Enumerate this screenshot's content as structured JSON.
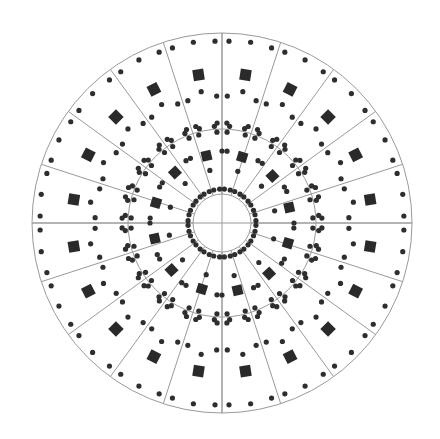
{
  "diagram": {
    "type": "concentric-radial-layout",
    "canvas": {
      "width": 440,
      "height": 439,
      "background": "#ffffff"
    },
    "center": {
      "x": 222,
      "y": 223
    },
    "colors": {
      "line": "#9a9a9a",
      "dot": "#2e2e2e",
      "square": "#2a2a2a"
    },
    "circles": [
      {
        "name": "outer-circle",
        "r": 190
      },
      {
        "name": "middle-circle",
        "r": 94
      },
      {
        "name": "inner-circle",
        "r": 29
      }
    ],
    "cross_lines": {
      "extent": 190
    },
    "radial_lines": {
      "count": 20,
      "start_deg": 0,
      "step_deg": 18,
      "r_from": 29,
      "r_to": 190
    },
    "outer_ring": {
      "sector_count": 20,
      "square": {
        "r": 150,
        "size": 11,
        "offset_deg": 9
      },
      "square_dot": {
        "r": 133,
        "offset_deg": 9
      },
      "rim_mid_dot": {
        "r": 183,
        "offset_deg": 9
      },
      "rim_pair_dots": {
        "r": 182,
        "spread_deg": 2.2
      },
      "line_pair_dots": {
        "r": 127,
        "spread_deg": 2.4
      }
    },
    "middle_ring": {
      "circle_dots": {
        "r": 97,
        "count": 40,
        "offset_deg": 4.5
      },
      "line_pair_dots": {
        "r": 91,
        "spread_deg": 3.2
      },
      "line_pair_dots_outer": {
        "r": 100,
        "spread_deg": 2.8
      }
    },
    "inner_ring": {
      "sector_count": 12,
      "square": {
        "r": 69,
        "size": 10,
        "start_deg": 13,
        "step_deg": 30
      },
      "square_dot": {
        "r": 54,
        "start_deg": 13,
        "step_deg": 30
      },
      "side_dots": {
        "r": 72,
        "start_deg": 13,
        "step_deg": 30,
        "spread_deg": 13
      },
      "hub_pair_dots": {
        "r": 34,
        "count": 20,
        "start_deg": 0,
        "step_deg": 18,
        "spread_deg": 8
      }
    },
    "dot_radius": 2.6
  }
}
